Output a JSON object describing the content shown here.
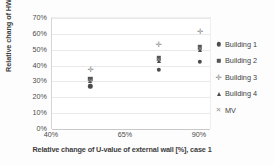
{
  "chart_data": {
    "type": "scatter",
    "title": "",
    "xlabel": "Relative change of U-value of external wall [%], case 1",
    "ylabel": "Relative chang of HWB [%]",
    "grid": true,
    "legend_position": "right",
    "xticklabels": [
      "40%",
      "65%",
      "90%"
    ],
    "yticklabels": [
      "0%",
      "10%",
      "20%",
      "30%",
      "40%",
      "50%",
      "60%",
      "70%"
    ],
    "ylim": [
      0,
      70
    ],
    "ytick_step": 10,
    "x_categories": [
      40,
      65,
      90
    ],
    "series": [
      {
        "name": "Building 1",
        "marker": "filled-circle",
        "color": "#4c4c4c",
        "points": [
          {
            "x": 53,
            "y": 27
          },
          {
            "x": 76,
            "y": 37.5
          },
          {
            "x": 90,
            "y": 42.5
          }
        ]
      },
      {
        "name": "Building 2",
        "marker": "filled-square",
        "color": "#555555",
        "points": [
          {
            "x": 53,
            "y": 31.5
          },
          {
            "x": 76,
            "y": 44.5
          },
          {
            "x": 90,
            "y": 51.5
          }
        ]
      },
      {
        "name": "Building 3",
        "marker": "plus",
        "color": "#8a8a8a",
        "points": [
          {
            "x": 53,
            "y": 38
          },
          {
            "x": 76,
            "y": 53.5
          },
          {
            "x": 90,
            "y": 61.5
          }
        ]
      },
      {
        "name": "Building 4",
        "marker": "triangle",
        "color": "#4a4a4a",
        "points": [
          {
            "x": 53,
            "y": 30
          },
          {
            "x": 76,
            "y": 43
          },
          {
            "x": 90,
            "y": 50
          }
        ]
      },
      {
        "name": "MV",
        "marker": "cross",
        "color": "#909090",
        "points": [
          {
            "x": 53,
            "y": 30.5
          },
          {
            "x": 76,
            "y": 43.5
          },
          {
            "x": 90,
            "y": 50.5
          }
        ]
      }
    ]
  },
  "legend": {
    "items": [
      {
        "label": "Building 1",
        "marker": "filled-circle"
      },
      {
        "label": "Building 2",
        "marker": "filled-square"
      },
      {
        "label": "Building 3",
        "marker": "plus"
      },
      {
        "label": "Building 4",
        "marker": "triangle"
      },
      {
        "label": "MV",
        "marker": "cross"
      }
    ]
  },
  "glyphs": {
    "plus": "✛",
    "cross": "✕"
  }
}
